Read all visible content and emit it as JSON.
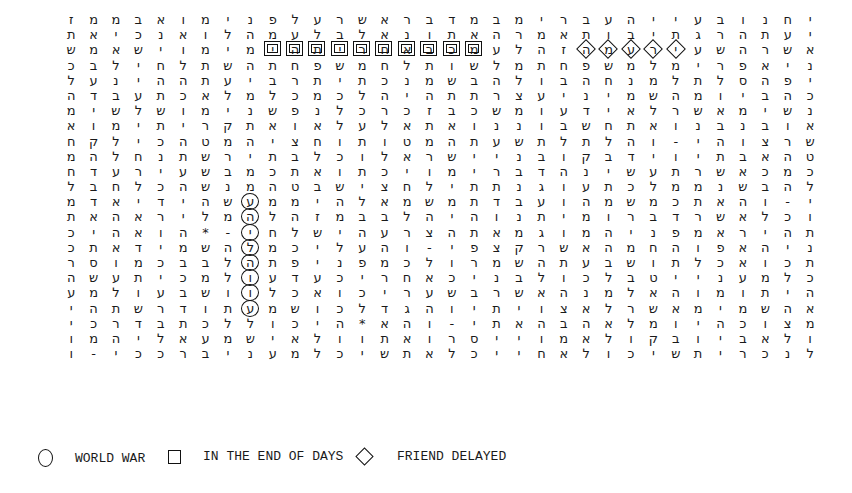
{
  "grid": {
    "direction": "rtl-text-rendered-visually",
    "rows": [
      "ז מ מ ב א ו מ י נ פ ל ע ר ש א ר ב ד מ ב מ י ר ב ע ה י י ע ב ו נ ח י ו ת ב א",
      "ת א י כ נ א ו ל ה מ ע ל ב ל א נ ו ת א ה ר מ א ת ו ב י ת ג ר ה ת ע י כ י",
      "ש מ א ש י ו מ י מ י ה ת י ר ח א ב כ מ ע ל ה ז ה מ ע ר י ע ש ה ר ש א כ צ ע י",
      "כ ב ל י ח ל ת ש ה ת ח פ ש מ ח ל ת ו ש ל מ ת ח פ ש מ ל מ י ר פ א י נ ב ה ל א",
      "ל ע נ י ה ה ת ע י ב ר ת י ת כ נ מ ש ב ה ל ו ב ה ח נ מ ל ת ל ס ה פ י א ה ת",
      "ה ד ב ע ת כ א ל מ ל כ מ כ ל ה י ה ת ת ר צ ע י נ י מ ש ה מ ו י ב ה כ ס נ ו ה",
      "מ י ש ל ש ו מ י נ ש פ נ ל כ ר כ ז ב כ ש מ ו ע ד י א ל ר ש א מ י ש נ ה נ מ",
      "א ו מ י ת י ר ק ת א ו א ל ע ל א ת א ו נ נ ו ב ש ח ת א ו נ ב נ ב ו א ר י נ ב ו",
      "ח ק ל י כ ה ט מ ה י צ ח ו ת ו ט מ ה ת ע ש ת ל ת ל ה ו - י ה ו צ ר ש א ל ר",
      "מ ה ל ח נ ת ש ר י ת ב ל כ ו ל א ר ש י י נ ב ו ק ב ד י ו י ת ב א ה ט מ ת ל ח",
      "ח ד ע ר י ע ש ב מ כ ת א ו ת כ י ו מ י ר ב ד ה נ י ש ע ת ר ש א כ מ כ ת א ו",
      "ל ב ח ל כ ה ש נ מ ה ט ב ש י צ ח ל י ת ת נ ג ו ע ת כ ל מ מ נ ש ב ה ל כ ו ד ע",
      "מ ד א י ד י ה ש ע מ מ י ה ל א מ ש מ ת ד ב ע ו ה מ ש מ כ ת א ה ו - י ג ה נ י",
      "ת א ה א ר י ל מ ה ל ה ז מ ב ב ל ה י ה ו נ ת י מ ו ר ב ד ר ש א ל כ ו ב י ט",
      "כ י ה א ו ה * - י ח ל ש י ה ע ר צ ה ת א מ ג ו מ ה י נ פ מ א ר י ה ת א ר ש א",
      "כ ת א ד י מ ש ה ל מ כ י ל ע ה ו - י פ צ ק ר ש א ה מ ח ה ו פ א ה י נ פ מ י ת",
      "ר ס ו מ כ ב ב ל ה ת פ י נ פ מ כ ל ו ר מ ש ה ת ע ב ש ו ת ל כ א ו כ ת מ ה ב ל",
      "ה ש ע ת י כ מ ל ו ע ד ע כ י ר ח א כ י נ ב ל ו כ ל ב ט י י נ ע מ ל כ ו צ מ י",
      "ע מ ל ו ע ב ש ו ו ל כ א ו כ י ר ע ש ב ר ש א ה נ מ ל א ה ו מ ו ת י ה ו ר ג ה",
      "י ה ת ש ר ד ו ת ע מ ש ו כ ל ד ג ה ו י ת י ו צ א ל ר ש א מ י מ ש ה א ב צ ל כ",
      "י כ ר ד ב ת כ ל ל ו כ י ה * א ה ו - י ת א ה ב ה א ל מ ו י ה כ ו צ מ י כ נ א",
      "ו מ ה י ל א ע מ ש י א ל ו ו ת א ו ר ס י י ו מ א ל ו ק ב ו י ב א ל ו ק ב ע",
      "ו - י כ כ ר ב י נ ע מ ל כ י ש ת א ל כ י י ח א ל ו כ י ש ת י ר כ נ ל כ ש י ר ש"
    ]
  },
  "highlights": {
    "box_row": 2,
    "box_cols": [
      9,
      10,
      11,
      12,
      13,
      14,
      15,
      16,
      17,
      18
    ],
    "diamond_row": 2,
    "diamond_cols": [
      23,
      24,
      25,
      26,
      27
    ],
    "circle_col": 8,
    "circle_rows": [
      12,
      13,
      14,
      15,
      16,
      17,
      18,
      19
    ]
  },
  "legend": [
    {
      "shape": "circle",
      "label": "WORLD WAR"
    },
    {
      "shape": "square",
      "label": "IN THE END OF DAYS"
    },
    {
      "shape": "diamond",
      "label": "FRIEND DELAYED"
    }
  ]
}
